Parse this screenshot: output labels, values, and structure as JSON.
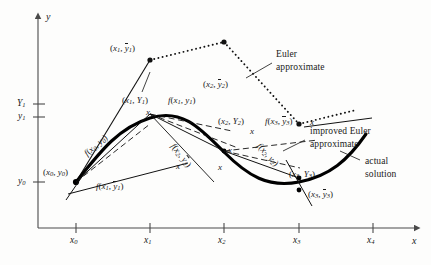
{
  "figure": {
    "axes": {
      "x_label": "x",
      "y_label": "y",
      "x_ticks": [
        "x0",
        "x1",
        "x2",
        "x3",
        "x4"
      ],
      "x_tick_text": [
        "x",
        "x",
        "x",
        "x",
        "x"
      ],
      "x_tick_subs": [
        "0",
        "1",
        "2",
        "3",
        "4"
      ],
      "y_ticks": [
        "Y1",
        "y1",
        "y0"
      ],
      "y_tick_text": [
        "Y",
        "y",
        "y"
      ],
      "y_tick_subs": [
        "1",
        "1",
        "0"
      ]
    },
    "point_labels": [
      {
        "id": "p-x0y0",
        "text": "(x0, y0)",
        "lead": "(",
        "v1": "x",
        "s1": "0",
        "sep": ", ",
        "v2": "y",
        "s2": "0",
        "bar2": false,
        "tail": ")"
      },
      {
        "id": "p-x1y1bar",
        "text": "(x1, y1bar)",
        "lead": "(",
        "v1": "x",
        "s1": "1",
        "sep": ", ",
        "v2": "y",
        "s2": "1",
        "bar2": true,
        "tail": ")"
      },
      {
        "id": "p-x1Y1",
        "text": "(x1, Y1)",
        "lead": "(",
        "v1": "x",
        "s1": "1",
        "sep": ", ",
        "v2": "Y",
        "s2": "1",
        "bar2": false,
        "tail": ")"
      },
      {
        "id": "p-x2y2bar",
        "text": "(x2, y2bar)",
        "lead": "(",
        "v1": "x",
        "s1": "2",
        "sep": ", ",
        "v2": "y",
        "s2": "2",
        "bar2": true,
        "tail": ")"
      },
      {
        "id": "p-x2Y2",
        "text": "(x2, Y2)",
        "lead": "(",
        "v1": "x",
        "s1": "2",
        "sep": ", ",
        "v2": "Y",
        "s2": "2",
        "bar2": false,
        "tail": ")"
      },
      {
        "id": "p-x3Y3",
        "text": "(x3, Y3)",
        "lead": "(",
        "v1": "x",
        "s1": "3",
        "sep": ", ",
        "v2": "Y",
        "s2": "3",
        "bar2": false,
        "tail": ")"
      },
      {
        "id": "p-x3y3bar",
        "text": "(x3, y3bar)",
        "lead": "(",
        "v1": "x",
        "s1": "3",
        "sep": ", ",
        "v2": "y",
        "s2": "3",
        "bar2": true,
        "tail": ")"
      }
    ],
    "slope_labels": [
      {
        "id": "f-x0y0",
        "fn": "f",
        "lead": "(",
        "v1": "x",
        "s1": "0",
        "sep": ", ",
        "v2": "y",
        "s2": "0",
        "bar2": false,
        "tail": ")"
      },
      {
        "id": "f-x1y1",
        "fn": "f",
        "lead": "(",
        "v1": "x",
        "s1": "1",
        "sep": ", ",
        "v2": "y",
        "s2": "1",
        "bar2": false,
        "tail": ")"
      },
      {
        "id": "f-x1y1bar",
        "fn": "f",
        "lead": "(",
        "v1": "x",
        "s1": "1",
        "sep": ", ",
        "v2": "y",
        "s2": "1",
        "bar2": true,
        "tail": ")"
      },
      {
        "id": "f-x2y2bar",
        "fn": "f",
        "lead": "(",
        "v1": "x",
        "s1": "2",
        "sep": ", ",
        "v2": "y",
        "s2": "2",
        "bar2": true,
        "tail": ")"
      },
      {
        "id": "f-x2y2",
        "fn": "f",
        "lead": "(",
        "v1": "x",
        "s1": "2",
        "sep": ", ",
        "v2": "y",
        "s2": "2",
        "bar2": false,
        "tail": ")"
      },
      {
        "id": "f-x3y3bar",
        "fn": "f",
        "lead": "(",
        "v1": "x",
        "s1": "3",
        "sep": ", ",
        "v2": "y",
        "s2": "3",
        "bar2": true,
        "tail": ")"
      }
    ],
    "annotations": {
      "euler_line1": "Euler",
      "euler_line2": "approximate",
      "improved_line1": "improved Euler",
      "improved_line2": "approximate",
      "actual_line1": "actual",
      "actual_line2": "solution"
    },
    "slope_markers": [
      "x",
      "x",
      "x",
      "x",
      "x",
      "x"
    ],
    "colors": {
      "ink": "#1a1a1a",
      "axis": "#4a4a4a",
      "curve": "#000000",
      "background": "#fdfdfc"
    }
  }
}
